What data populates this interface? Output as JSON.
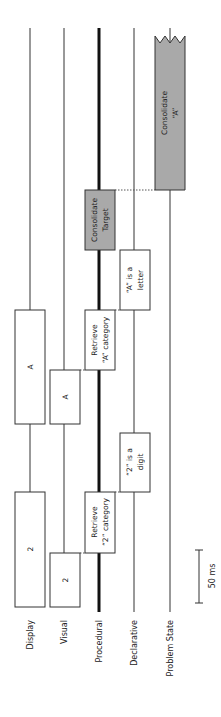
{
  "diagram": {
    "orientation": "rotated-90-ccw",
    "lanes": [
      {
        "id": "display",
        "label": "Display",
        "x": 30,
        "width": 1,
        "color": "#333333"
      },
      {
        "id": "visual",
        "label": "Visual",
        "x": 64,
        "width": 1,
        "color": "#333333"
      },
      {
        "id": "procedural",
        "label": "Procedural",
        "x": 99,
        "width": 3,
        "color": "#111111"
      },
      {
        "id": "declarative",
        "label": "Declarative",
        "x": 134,
        "width": 1,
        "color": "#333333"
      },
      {
        "id": "problem_state",
        "label": "Problem State",
        "x": 170,
        "width": 1,
        "color": "#333333"
      }
    ],
    "boxes": [
      {
        "id": "display-2",
        "lane": "display",
        "line1": "2",
        "line2": "",
        "x": 15,
        "y": 492,
        "w": 30,
        "h": 115,
        "fill": "#ffffff"
      },
      {
        "id": "visual-2",
        "lane": "visual",
        "line1": "2",
        "line2": "",
        "x": 50,
        "y": 553,
        "w": 30,
        "h": 54,
        "fill": "#ffffff"
      },
      {
        "id": "retrieve-2",
        "lane": "procedural",
        "line1": "Retrieve",
        "line2": "“2” category",
        "x": 85,
        "y": 492,
        "w": 30,
        "h": 61,
        "fill": "#ffffff"
      },
      {
        "id": "decl-2",
        "lane": "declarative",
        "line1": "“2” is a",
        "line2": "digit",
        "x": 120,
        "y": 433,
        "w": 30,
        "h": 59,
        "fill": "#ffffff"
      },
      {
        "id": "display-A",
        "lane": "display",
        "line1": "A",
        "line2": "",
        "x": 15,
        "y": 310,
        "w": 30,
        "h": 114,
        "fill": "#ffffff"
      },
      {
        "id": "visual-A",
        "lane": "visual",
        "line1": "A",
        "line2": "",
        "x": 50,
        "y": 370,
        "w": 30,
        "h": 54,
        "fill": "#ffffff"
      },
      {
        "id": "retrieve-A",
        "lane": "procedural",
        "line1": "Retrieve",
        "line2": "“A” category",
        "x": 85,
        "y": 310,
        "w": 30,
        "h": 60,
        "fill": "#ffffff"
      },
      {
        "id": "decl-A",
        "lane": "declarative",
        "line1": "“A” is a",
        "line2": "letter",
        "x": 120,
        "y": 250,
        "w": 30,
        "h": 60,
        "fill": "#ffffff"
      },
      {
        "id": "consolidate-target",
        "lane": "procedural",
        "line1": "Consolidate",
        "line2": "Target",
        "x": 85,
        "y": 190,
        "w": 30,
        "h": 60,
        "fill": "#a9a9a9"
      },
      {
        "id": "consolidate-A",
        "lane": "problem_state",
        "line1": "Consolidate",
        "line2": "“A”",
        "x": 155,
        "y": 33,
        "w": 30,
        "h": 157,
        "fill": "#a9a9a9"
      }
    ],
    "scale_bar": {
      "label": "50 ms",
      "x": 199,
      "y1": 550,
      "y2": 603
    },
    "colors": {
      "box_stroke": "#333333",
      "gray_fill": "#a9a9a9",
      "dotted": "#555555"
    }
  }
}
